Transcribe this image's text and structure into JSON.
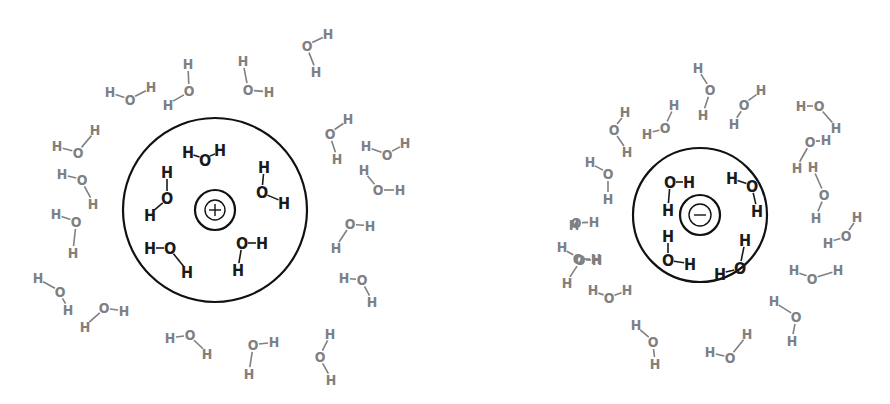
{
  "diagram": {
    "colors": {
      "inner_water": "#1a1a1a",
      "outer_water": "#808080",
      "ring": "#111111"
    },
    "cation": {
      "symbol": "+",
      "center": [
        215,
        210
      ],
      "shell_radius": 92,
      "ion_radius": 20,
      "core_radius": 10,
      "inner_waters": [
        {
          "atoms": [
            [
              "H",
              188,
              152
            ],
            [
              "O",
              205,
              160
            ],
            [
              "H",
              220,
              150
            ]
          ]
        },
        {
          "atoms": [
            [
              "H",
              167,
              172
            ],
            [
              "O",
              167,
              198
            ],
            [
              "H",
              150,
              215
            ]
          ]
        },
        {
          "atoms": [
            [
              "H",
              264,
              167
            ],
            [
              "O",
              262,
              192
            ],
            [
              "H",
              284,
              203
            ]
          ]
        },
        {
          "atoms": [
            [
              "H",
              150,
              248
            ],
            [
              "O",
              170,
              248
            ],
            [
              "H",
              187,
              272
            ]
          ]
        },
        {
          "atoms": [
            [
              "O",
              242,
              243
            ],
            [
              "H",
              262,
              243
            ],
            [
              "H",
              238,
              270
            ]
          ]
        }
      ],
      "outer_waters": [
        {
          "atoms": [
            [
              "H",
              110,
              92
            ],
            [
              "O",
              130,
              100
            ],
            [
              "H",
              151,
              87
            ]
          ]
        },
        {
          "atoms": [
            [
              "H",
              188,
              64
            ],
            [
              "O",
              189,
              91
            ],
            [
              "H",
              168,
              105
            ]
          ]
        },
        {
          "atoms": [
            [
              "H",
              243,
              61
            ],
            [
              "O",
              248,
              90
            ],
            [
              "H",
              269,
              92
            ]
          ]
        },
        {
          "atoms": [
            [
              "O",
              307,
              46
            ],
            [
              "H",
              328,
              34
            ],
            [
              "H",
              316,
              72
            ]
          ]
        },
        {
          "atoms": [
            [
              "H",
              57,
              146
            ],
            [
              "O",
              78,
              153
            ],
            [
              "H",
              95,
              130
            ]
          ]
        },
        {
          "atoms": [
            [
              "H",
              62,
              174
            ],
            [
              "O",
              82,
              180
            ],
            [
              "H",
              93,
              204
            ]
          ]
        },
        {
          "atoms": [
            [
              "H",
              56,
              214
            ],
            [
              "O",
              76,
              222
            ],
            [
              "H",
              73,
              253
            ]
          ]
        },
        {
          "atoms": [
            [
              "H",
              38,
              278
            ],
            [
              "O",
              60,
              292
            ],
            [
              "H",
              68,
              310
            ]
          ]
        },
        {
          "atoms": [
            [
              "O",
              104,
              308
            ],
            [
              "H",
              124,
              311
            ],
            [
              "H",
              85,
              327
            ]
          ]
        },
        {
          "atoms": [
            [
              "H",
              170,
              338
            ],
            [
              "O",
              190,
              335
            ],
            [
              "H",
              207,
              354
            ]
          ]
        },
        {
          "atoms": [
            [
              "O",
              253,
              345
            ],
            [
              "H",
              274,
              342
            ],
            [
              "H",
              249,
              374
            ]
          ]
        },
        {
          "atoms": [
            [
              "H",
              330,
              334
            ],
            [
              "O",
              320,
              357
            ],
            [
              "H",
              331,
              380
            ]
          ]
        },
        {
          "atoms": [
            [
              "O",
              330,
              134
            ],
            [
              "H",
              348,
              119
            ],
            [
              "H",
              337,
              159
            ]
          ]
        },
        {
          "atoms": [
            [
              "H",
              366,
              146
            ],
            [
              "O",
              387,
              155
            ],
            [
              "H",
              405,
              143
            ]
          ]
        },
        {
          "atoms": [
            [
              "H",
              364,
              170
            ],
            [
              "O",
              378,
              190
            ],
            [
              "H",
              400,
              190
            ]
          ]
        },
        {
          "atoms": [
            [
              "O",
              350,
              224
            ],
            [
              "H",
              370,
              226
            ],
            [
              "H",
              336,
              248
            ]
          ]
        },
        {
          "atoms": [
            [
              "H",
              344,
              278
            ],
            [
              "O",
              362,
              280
            ],
            [
              "H",
              372,
              302
            ]
          ]
        }
      ]
    },
    "anion": {
      "symbol": "−",
      "center": [
        700,
        215
      ],
      "shell_radius": 67,
      "ion_radius": 20,
      "core_radius": 11,
      "inner_waters": [
        {
          "atoms": [
            [
              "O",
              670,
              182
            ],
            [
              "H",
              689,
              182
            ],
            [
              "H",
              668,
              210
            ]
          ]
        },
        {
          "atoms": [
            [
              "H",
              732,
              178
            ],
            [
              "O",
              752,
              186
            ],
            [
              "H",
              757,
              211
            ]
          ]
        },
        {
          "atoms": [
            [
              "H",
              668,
              236
            ],
            [
              "O",
              668,
              260
            ],
            [
              "H",
              690,
              264
            ]
          ]
        },
        {
          "atoms": [
            [
              "H",
              745,
              240
            ],
            [
              "O",
              740,
              268
            ],
            [
              "H",
              720,
              274
            ]
          ]
        }
      ],
      "outer_waters": [
        {
          "atoms": [
            [
              "H",
              590,
              162
            ],
            [
              "O",
              608,
              174
            ],
            [
              "H",
              608,
              199
            ]
          ]
        },
        {
          "atoms": [
            [
              "O",
              614,
              130
            ],
            [
              "H",
              625,
              112
            ],
            [
              "H",
              627,
              152
            ]
          ]
        },
        {
          "atoms": [
            [
              "H",
              647,
              134
            ],
            [
              "O",
              665,
              128
            ],
            [
              "H",
              674,
              105
            ]
          ]
        },
        {
          "atoms": [
            [
              "H",
              698,
              68
            ],
            [
              "O",
              710,
              90
            ],
            [
              "H",
              703,
              115
            ]
          ]
        },
        {
          "atoms": [
            [
              "H",
              734,
              124
            ],
            [
              "O",
              744,
              105
            ],
            [
              "H",
              761,
              90
            ]
          ]
        },
        {
          "atoms": [
            [
              "H",
              801,
              106
            ],
            [
              "O",
              819,
              106
            ],
            [
              "H",
              836,
              128
            ]
          ]
        },
        {
          "atoms": [
            [
              "O",
              810,
              142
            ],
            [
              "H",
              826,
              140
            ],
            [
              "H",
              797,
              168
            ]
          ]
        },
        {
          "atoms": [
            [
              "H",
              813,
              167
            ],
            [
              "O",
              824,
              195
            ],
            [
              "H",
              816,
              218
            ]
          ]
        },
        {
          "atoms": [
            [
              "H",
              828,
              243
            ],
            [
              "O",
              846,
              236
            ],
            [
              "H",
              857,
              217
            ]
          ]
        },
        {
          "atoms": [
            [
              "H",
              794,
              270
            ],
            [
              "O",
              812,
              279
            ],
            [
              "H",
              838,
              270
            ]
          ]
        },
        {
          "atoms": [
            [
              "H",
              574,
              225
            ],
            [
              "O",
              576,
              223
            ],
            [
              "H",
              594,
              222
            ]
          ]
        },
        {
          "atoms": [
            [
              "O",
              578,
              259
            ],
            [
              "H",
              596,
              259
            ],
            [
              "H",
              562,
              247
            ]
          ]
        },
        {
          "atoms": [
            [
              "O",
              580,
              260
            ],
            [
              "H",
              597,
              260
            ],
            [
              "H",
              567,
              283
            ]
          ]
        },
        {
          "atoms": [
            [
              "H",
              593,
              290
            ],
            [
              "O",
              609,
              298
            ],
            [
              "H",
              627,
              290
            ]
          ]
        },
        {
          "atoms": [
            [
              "H",
              636,
              325
            ],
            [
              "O",
              653,
              342
            ],
            [
              "H",
              655,
              364
            ]
          ]
        },
        {
          "atoms": [
            [
              "H",
              710,
              352
            ],
            [
              "O",
              730,
              358
            ],
            [
              "H",
              747,
              334
            ]
          ]
        },
        {
          "atoms": [
            [
              "H",
              774,
              301
            ],
            [
              "O",
              796,
              317
            ],
            [
              "H",
              792,
              341
            ]
          ]
        }
      ]
    }
  }
}
